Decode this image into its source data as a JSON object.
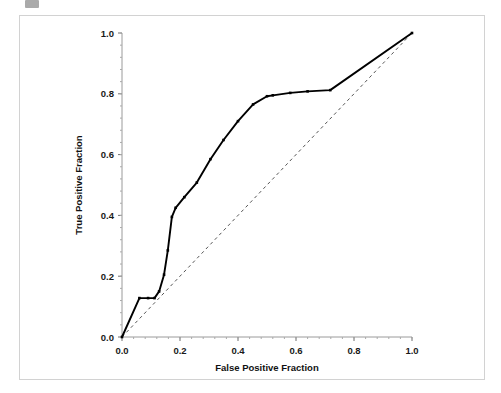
{
  "figure": {
    "background_color": "#ffffff",
    "frame_color": "#d2d2d2",
    "axis_color": "#999999",
    "curve_color": "#000000",
    "reference_color": "#555555"
  },
  "chart_data": {
    "type": "line",
    "title": "",
    "xlabel": "False Positive Fraction",
    "ylabel": "True Positive Fraction",
    "xlim": [
      0.0,
      1.0
    ],
    "ylim": [
      0.0,
      1.0
    ],
    "grid": false,
    "legend": "none",
    "xticks": [
      "0.0",
      "0.2",
      "0.4",
      "0.6",
      "0.8",
      "1.0"
    ],
    "xtick_values": [
      0.0,
      0.2,
      0.4,
      0.6,
      0.8,
      1.0
    ],
    "yticks": [
      "0.0",
      "0.2",
      "0.4",
      "0.6",
      "0.8",
      "1.0"
    ],
    "ytick_values": [
      0.0,
      0.2,
      0.4,
      0.6,
      0.8,
      1.0
    ],
    "minor_ticks": true,
    "series": [
      {
        "name": "ROC curve",
        "style": "solid",
        "markers": true,
        "x": [
          0.0,
          0.06,
          0.09,
          0.112,
          0.128,
          0.145,
          0.158,
          0.172,
          0.185,
          0.215,
          0.258,
          0.305,
          0.35,
          0.4,
          0.452,
          0.5,
          0.52,
          0.58,
          0.64,
          0.718,
          1.0
        ],
        "y": [
          0.0,
          0.128,
          0.128,
          0.128,
          0.15,
          0.205,
          0.285,
          0.395,
          0.425,
          0.46,
          0.508,
          0.585,
          0.648,
          0.71,
          0.765,
          0.792,
          0.795,
          0.803,
          0.808,
          0.812,
          1.0
        ]
      },
      {
        "name": "Chance reference line",
        "style": "dashed",
        "markers": false,
        "x": [
          0.0,
          1.0
        ],
        "y": [
          0.0,
          1.0
        ]
      }
    ]
  }
}
